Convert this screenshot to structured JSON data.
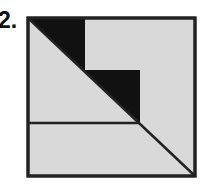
{
  "problem": {
    "label": "2."
  },
  "figure": {
    "fill_color": "#d9d9d9",
    "dark_color": "#111111",
    "stroke_color": "#222222",
    "square": {
      "x": 28,
      "y": 18,
      "width": 167,
      "height": 158
    },
    "dark_region_points": "28,18 85,18 85,70 140,70 140,123",
    "horizontal_line": {
      "x1": 28,
      "y1": 123,
      "x2": 140,
      "y2": 123
    },
    "diagonal_line": {
      "x1": 28,
      "y1": 18,
      "x2": 195,
      "y2": 176
    }
  }
}
